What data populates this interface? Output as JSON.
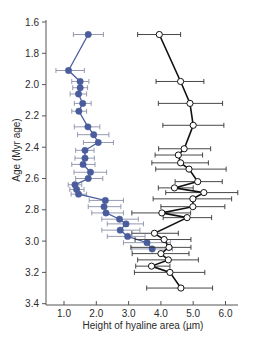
{
  "chart_data": {
    "type": "line",
    "title": "",
    "xlabel": "Height of hyaline area (µm)",
    "ylabel": "Age (Myr age)",
    "xlim": [
      0.5,
      6.4
    ],
    "ylim": [
      3.4,
      1.6
    ],
    "y_inverted": true,
    "grid": false,
    "x_ticks": [
      "1.0",
      "2.0",
      "3.0",
      "4.0",
      "5.0",
      "6.0"
    ],
    "y_ticks": [
      "1.6",
      "1.8",
      "2.0",
      "2.2",
      "2.4",
      "2.6",
      "2.8",
      "3.0",
      "3.2",
      "3.4"
    ],
    "series": [
      {
        "name": "filled-blue",
        "marker": "filled-circle",
        "color": "#4a5c9c",
        "errorbar_color": "#8a90a8",
        "points": [
          {
            "x": 1.75,
            "age": 1.68,
            "xerr": [
              1.29,
              2.22
            ]
          },
          {
            "x": 1.14,
            "age": 1.91,
            "xerr": [
              0.75,
              1.63
            ]
          },
          {
            "x": 1.5,
            "age": 1.98,
            "xerr": [
              1.24,
              1.77
            ]
          },
          {
            "x": 1.5,
            "age": 2.02,
            "xerr": [
              1.27,
              1.73
            ]
          },
          {
            "x": 1.45,
            "age": 2.06,
            "xerr": [
              1.19,
              1.7
            ]
          },
          {
            "x": 1.58,
            "age": 2.12,
            "xerr": [
              1.32,
              1.84
            ]
          },
          {
            "x": 1.46,
            "age": 2.17,
            "xerr": [
              1.24,
              1.7
            ]
          },
          {
            "x": 1.74,
            "age": 2.27,
            "xerr": [
              1.32,
              2.11
            ]
          },
          {
            "x": 1.92,
            "age": 2.32,
            "xerr": [
              1.42,
              2.39
            ]
          },
          {
            "x": 2.06,
            "age": 2.37,
            "xerr": [
              1.6,
              2.53
            ]
          },
          {
            "x": 1.65,
            "age": 2.42,
            "xerr": [
              1.36,
              1.93
            ]
          },
          {
            "x": 1.65,
            "age": 2.47,
            "xerr": [
              1.34,
              1.94
            ]
          },
          {
            "x": 1.59,
            "age": 2.51,
            "xerr": [
              1.24,
              1.96
            ]
          },
          {
            "x": 1.82,
            "age": 2.56,
            "xerr": [
              1.31,
              2.32
            ]
          },
          {
            "x": 1.75,
            "age": 2.6,
            "xerr": [
              1.36,
              2.2
            ]
          },
          {
            "x": 1.34,
            "age": 2.64,
            "xerr": [
              1.13,
              1.55
            ]
          },
          {
            "x": 1.39,
            "age": 2.67,
            "xerr": [
              1.18,
              1.62
            ]
          },
          {
            "x": 1.45,
            "age": 2.7,
            "xerr": [
              1.22,
              1.7
            ]
          },
          {
            "x": 2.28,
            "age": 2.74,
            "xerr": [
              1.78,
              2.84
            ]
          },
          {
            "x": 2.24,
            "age": 2.78,
            "xerr": [
              1.75,
              2.76
            ]
          },
          {
            "x": 2.3,
            "age": 2.82,
            "xerr": [
              1.86,
              2.84
            ]
          },
          {
            "x": 2.72,
            "age": 2.86,
            "xerr": [
              2.17,
              3.3
            ]
          },
          {
            "x": 2.92,
            "age": 2.89,
            "xerr": [
              2.34,
              3.46
            ]
          },
          {
            "x": 2.74,
            "age": 2.93,
            "xerr": [
              2.17,
              3.35
            ]
          },
          {
            "x": 2.97,
            "age": 2.97,
            "xerr": [
              2.34,
              3.51
            ]
          },
          {
            "x": 3.57,
            "age": 3.01,
            "xerr": [
              2.84,
              4.3
            ]
          },
          {
            "x": 3.73,
            "age": 3.05,
            "xerr": [
              3.1,
              4.36
            ]
          }
        ]
      },
      {
        "name": "open-black",
        "marker": "open-circle",
        "color": "#111111",
        "errorbar_color": "#333333",
        "points": [
          {
            "x": 3.95,
            "age": 1.68,
            "xerr": [
              3.28,
              4.61
            ]
          },
          {
            "x": 4.61,
            "age": 1.98,
            "xerr": [
              3.85,
              5.33
            ]
          },
          {
            "x": 4.9,
            "age": 2.12,
            "xerr": [
              3.92,
              5.91
            ]
          },
          {
            "x": 5.0,
            "age": 2.26,
            "xerr": [
              4.06,
              5.95
            ]
          },
          {
            "x": 4.72,
            "age": 2.41,
            "xerr": [
              3.93,
              5.54
            ]
          },
          {
            "x": 4.54,
            "age": 2.45,
            "xerr": [
              3.82,
              5.29
            ]
          },
          {
            "x": 4.61,
            "age": 2.5,
            "xerr": [
              3.72,
              5.47
            ]
          },
          {
            "x": 4.87,
            "age": 2.54,
            "xerr": [
              3.84,
              6.02
            ]
          },
          {
            "x": 5.14,
            "age": 2.62,
            "xerr": [
              4.44,
              5.9
            ]
          },
          {
            "x": 4.42,
            "age": 2.66,
            "xerr": [
              3.92,
              5.0
            ]
          },
          {
            "x": 5.33,
            "age": 2.69,
            "xerr": [
              4.15,
              6.38
            ]
          },
          {
            "x": 4.99,
            "age": 2.73,
            "xerr": [
              3.76,
              6.19
            ]
          },
          {
            "x": 4.99,
            "age": 2.78,
            "xerr": [
              4.0,
              5.98
            ]
          },
          {
            "x": 4.03,
            "age": 2.82,
            "xerr": [
              3.1,
              4.92
            ]
          },
          {
            "x": 4.81,
            "age": 2.85,
            "xerr": [
              4.07,
              5.57
            ]
          },
          {
            "x": 3.8,
            "age": 2.95,
            "xerr": [
              3.1,
              4.54
            ]
          },
          {
            "x": 4.1,
            "age": 2.99,
            "xerr": [
              3.2,
              4.93
            ]
          },
          {
            "x": 4.25,
            "age": 3.04,
            "xerr": [
              3.07,
              4.93
            ]
          },
          {
            "x": 4.0,
            "age": 3.08,
            "xerr": [
              3.11,
              4.87
            ]
          },
          {
            "x": 4.23,
            "age": 3.12,
            "xerr": [
              3.28,
              5.16
            ]
          },
          {
            "x": 3.71,
            "age": 3.16,
            "xerr": [
              3.22,
              4.28
            ]
          },
          {
            "x": 4.28,
            "age": 3.2,
            "xerr": [
              3.18,
              5.36
            ]
          },
          {
            "x": 4.62,
            "age": 3.3,
            "xerr": [
              3.56,
              5.6
            ]
          }
        ]
      }
    ]
  }
}
